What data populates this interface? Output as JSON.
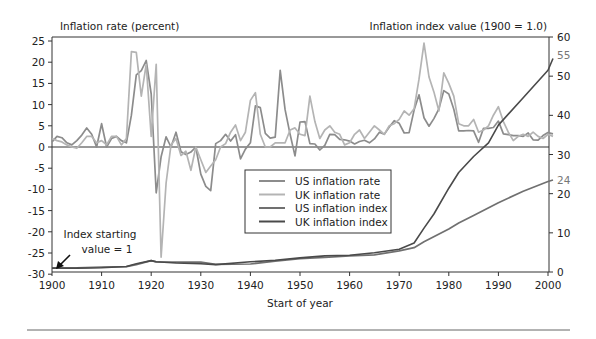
{
  "chart_data": {
    "type": "line",
    "title": "",
    "xlabel": "Start of year",
    "ylabel_left": "Inflation rate (percent)",
    "ylabel_right": "Inflation index value (1900 = 1.0)",
    "xlim": [
      1900,
      2001
    ],
    "ylim_left": [
      -30,
      25
    ],
    "ylim_right": [
      0,
      60
    ],
    "x_ticks": [
      1900,
      1910,
      1920,
      1930,
      1940,
      1950,
      1960,
      1970,
      1980,
      1990,
      2000
    ],
    "y_ticks_left": [
      25,
      20,
      15,
      10,
      5,
      0,
      -5,
      -10,
      -15,
      -20,
      -25,
      -30
    ],
    "y_ticks_right": [
      60,
      50,
      40,
      30,
      20,
      10,
      0
    ],
    "right_axis_highlights": [
      {
        "label": "55",
        "value": 55.5
      },
      {
        "label": "24",
        "value": 23.5
      }
    ],
    "grid": false,
    "legend_position": "center-right",
    "legend": [
      "US inflation rate",
      "UK inflation rate",
      "US inflation index",
      "UK inflation index"
    ],
    "annotations": [
      {
        "text_line1": "Index starting",
        "text_line2": "value = 1",
        "arrow_to": [
          1900,
          1
        ]
      }
    ],
    "series": [
      {
        "name": "US inflation rate",
        "axis": "left",
        "color": "#8c8c8c",
        "x": [
          1900,
          1901,
          1902,
          1903,
          1904,
          1905,
          1906,
          1907,
          1908,
          1909,
          1910,
          1911,
          1912,
          1913,
          1914,
          1915,
          1916,
          1917,
          1918,
          1919,
          1920,
          1921,
          1922,
          1923,
          1924,
          1925,
          1926,
          1927,
          1928,
          1929,
          1930,
          1931,
          1932,
          1933,
          1934,
          1935,
          1936,
          1937,
          1938,
          1939,
          1940,
          1941,
          1942,
          1943,
          1944,
          1945,
          1946,
          1947,
          1948,
          1949,
          1950,
          1951,
          1952,
          1953,
          1954,
          1955,
          1956,
          1957,
          1958,
          1959,
          1960,
          1961,
          1962,
          1963,
          1964,
          1965,
          1966,
          1967,
          1968,
          1969,
          1970,
          1971,
          1972,
          1973,
          1974,
          1975,
          1976,
          1977,
          1978,
          1979,
          1980,
          1981,
          1982,
          1983,
          1984,
          1985,
          1986,
          1987,
          1988,
          1989,
          1990,
          1991,
          1992,
          1993,
          1994,
          1995,
          1996,
          1997,
          1998,
          1999,
          2000,
          2001
        ],
        "values": [
          1.2,
          2.5,
          2.2,
          1.0,
          0.5,
          1.5,
          2.8,
          4.5,
          3.0,
          0.0,
          5.5,
          0.0,
          2.0,
          2.5,
          1.5,
          1.0,
          7.5,
          17.0,
          18.0,
          20.4,
          12.5,
          -10.8,
          -2.3,
          2.4,
          0.0,
          3.5,
          -1.1,
          -1.8,
          -1.2,
          0.0,
          -6.4,
          -9.3,
          -10.3,
          0.8,
          1.5,
          3.0,
          1.4,
          2.9,
          -2.8,
          -0.5,
          1.0,
          9.7,
          9.3,
          3.2,
          2.1,
          2.3,
          18.1,
          8.8,
          3.0,
          -2.1,
          5.9,
          6.0,
          0.8,
          0.7,
          -0.7,
          0.4,
          3.0,
          2.9,
          1.8,
          1.7,
          1.4,
          0.7,
          1.3,
          1.6,
          1.0,
          1.9,
          3.5,
          3.0,
          4.7,
          6.2,
          5.6,
          3.3,
          3.4,
          8.7,
          12.3,
          6.9,
          4.9,
          6.7,
          9.0,
          13.3,
          12.5,
          8.9,
          3.8,
          3.8,
          3.9,
          3.8,
          1.1,
          4.4,
          4.4,
          4.6,
          6.1,
          3.1,
          2.9,
          2.7,
          2.7,
          2.5,
          3.3,
          1.7,
          1.6,
          2.7,
          3.4,
          3.1
        ]
      },
      {
        "name": "UK inflation rate",
        "axis": "left",
        "color": "#b4b4b4",
        "x": [
          1900,
          1901,
          1902,
          1903,
          1904,
          1905,
          1906,
          1907,
          1908,
          1909,
          1910,
          1911,
          1912,
          1913,
          1914,
          1915,
          1916,
          1917,
          1918,
          1919,
          1920,
          1921,
          1922,
          1923,
          1924,
          1925,
          1926,
          1927,
          1928,
          1929,
          1930,
          1931,
          1932,
          1933,
          1934,
          1935,
          1936,
          1937,
          1938,
          1939,
          1940,
          1941,
          1942,
          1943,
          1944,
          1945,
          1946,
          1947,
          1948,
          1949,
          1950,
          1951,
          1952,
          1953,
          1954,
          1955,
          1956,
          1957,
          1958,
          1959,
          1960,
          1961,
          1962,
          1963,
          1964,
          1965,
          1966,
          1967,
          1968,
          1969,
          1970,
          1971,
          1972,
          1973,
          1974,
          1975,
          1976,
          1977,
          1978,
          1979,
          1980,
          1981,
          1982,
          1983,
          1984,
          1985,
          1986,
          1987,
          1988,
          1989,
          1990,
          1991,
          1992,
          1993,
          1994,
          1995,
          1996,
          1997,
          1998,
          1999,
          2000,
          2001
        ],
        "values": [
          2.0,
          1.5,
          1.2,
          0.5,
          0.0,
          -0.3,
          1.0,
          2.5,
          2.5,
          1.0,
          1.5,
          0.5,
          2.5,
          2.5,
          0.5,
          2.0,
          22.5,
          22.3,
          12.0,
          19.5,
          2.5,
          19.5,
          -26.0,
          -8.5,
          0.5,
          2.0,
          -2.0,
          -1.0,
          -5.5,
          0.0,
          -3.0,
          -6.0,
          -4.5,
          -3.0,
          0.0,
          0.8,
          3.5,
          5.2,
          1.5,
          3.5,
          11.0,
          12.8,
          3.0,
          0.0,
          0.0,
          1.0,
          1.0,
          1.0,
          4.0,
          4.5,
          3.0,
          2.7,
          12.0,
          6.0,
          2.0,
          4.0,
          5.0,
          3.5,
          3.0,
          0.5,
          1.0,
          3.0,
          4.0,
          2.0,
          3.5,
          5.0,
          4.0,
          3.0,
          5.0,
          5.5,
          6.5,
          8.5,
          7.5,
          9.0,
          16.0,
          24.5,
          16.5,
          13.0,
          8.5,
          17.5,
          15.0,
          12.0,
          5.5,
          5.0,
          5.0,
          6.5,
          3.5,
          4.0,
          5.0,
          7.5,
          9.5,
          6.0,
          3.5,
          1.5,
          2.5,
          3.0,
          2.5,
          3.5,
          2.5,
          2.0,
          3.0,
          2.5
        ]
      },
      {
        "name": "US inflation index",
        "axis": "right",
        "color": "#707070",
        "x": [
          1900,
          1905,
          1910,
          1915,
          1917,
          1920,
          1921,
          1925,
          1930,
          1933,
          1940,
          1945,
          1950,
          1955,
          1960,
          1965,
          1970,
          1973,
          1975,
          1980,
          1982,
          1985,
          1990,
          1995,
          2000,
          2001
        ],
        "values": [
          1.0,
          1.05,
          1.25,
          1.35,
          1.9,
          2.9,
          2.6,
          2.5,
          2.5,
          1.95,
          2.05,
          2.75,
          3.4,
          3.7,
          4.1,
          4.4,
          5.4,
          6.2,
          7.7,
          11.0,
          12.5,
          14.4,
          17.7,
          20.6,
          23.1,
          23.5
        ]
      },
      {
        "name": "UK inflation index",
        "axis": "right",
        "color": "#4a4a4a",
        "x": [
          1900,
          1905,
          1910,
          1915,
          1917,
          1920,
          1921,
          1925,
          1930,
          1933,
          1940,
          1945,
          1950,
          1955,
          1960,
          1965,
          1970,
          1973,
          1975,
          1977,
          1980,
          1982,
          1985,
          1988,
          1990,
          1995,
          2000,
          2001
        ],
        "values": [
          1.0,
          1.0,
          1.1,
          1.4,
          2.1,
          2.9,
          2.6,
          2.3,
          2.1,
          1.9,
          2.6,
          3.0,
          3.6,
          4.1,
          4.3,
          4.9,
          5.8,
          7.4,
          11.2,
          14.8,
          21.4,
          25.4,
          29.5,
          33.0,
          37.5,
          44.5,
          51.5,
          54.5
        ]
      }
    ]
  }
}
